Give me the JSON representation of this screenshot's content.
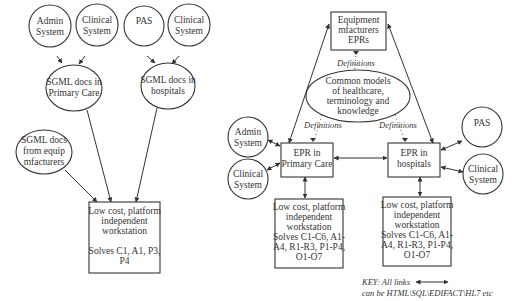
{
  "left_diagram": {
    "sources": [
      {
        "id": "admin",
        "lines": [
          "Admin",
          "System"
        ]
      },
      {
        "id": "clinical",
        "lines": [
          "Clinical",
          "System"
        ]
      },
      {
        "id": "pas",
        "lines": [
          "PAS"
        ]
      },
      {
        "id": "clinical2",
        "lines": [
          "Clinical",
          "System"
        ]
      }
    ],
    "sgml_primary": {
      "lines": [
        "SGML docs in",
        "Primary Care"
      ]
    },
    "sgml_hospitals": {
      "lines": [
        "SGML docs in",
        "hospitals"
      ]
    },
    "sgml_equip": {
      "lines": [
        "SGML docs",
        "from equip",
        "mfacturers"
      ]
    },
    "workstation": {
      "lines": [
        "Low cost, platform",
        "independent",
        "workstation",
        "",
        "Solves C1, A1, P3,",
        "P4"
      ]
    }
  },
  "right_diagram": {
    "equipment": {
      "lines": [
        "Equipment",
        "mfacturers",
        "EPRs"
      ]
    },
    "common_models": {
      "lines": [
        "Common models",
        "of healthcare,",
        "terminology and",
        "knowledge"
      ]
    },
    "definitions_label": "Definitions",
    "epr_primary": {
      "lines": [
        "EPR in",
        "Primary Care"
      ]
    },
    "epr_hospitals": {
      "lines": [
        "EPR in",
        "hospitals"
      ]
    },
    "admin": {
      "lines": [
        "Admin",
        "System"
      ]
    },
    "clinical_left": {
      "lines": [
        "Clinical",
        "System"
      ]
    },
    "pas": {
      "lines": [
        "PAS"
      ]
    },
    "clinical_right": {
      "lines": [
        "Clinical",
        "System"
      ]
    },
    "workstation_primary": {
      "lines": [
        "Low cost, platform",
        "independent",
        "workstation",
        "Solves C1-C6, A1-",
        "A4, R1-R3, P1-P4,",
        "O1-O7"
      ]
    },
    "workstation_hospitals": {
      "lines": [
        "Low cost, platform",
        "independent",
        "workstation",
        "Solves C1-C6, A1-",
        "A4, R1-R3, P1-P4,",
        "O1-O7"
      ]
    }
  },
  "key": {
    "line1": "KEY: All links",
    "line2": "can be HTML\\SQL\\EDIFACT\\HL7 etc"
  }
}
